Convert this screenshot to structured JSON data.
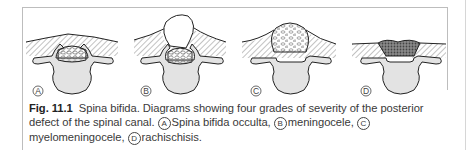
{
  "figure": {
    "panels": [
      {
        "letter": "A",
        "name": "Spina bifida occulta"
      },
      {
        "letter": "B",
        "name": "meningocele"
      },
      {
        "letter": "C",
        "name": "myelomeningocele"
      },
      {
        "letter": "D",
        "name": "rachischisis"
      }
    ],
    "colors": {
      "bone": "#e3e3e3",
      "outline": "#222222",
      "hatch": "#555555",
      "frame": "#bdbdbd"
    }
  },
  "caption": {
    "label": "Fig. 11.1",
    "text": "Spina bifida. Diagrams showing four grades of severity of the posterior defect of the spinal canal.",
    "items": [
      {
        "letter": "A",
        "text": "Spina bifida occulta,"
      },
      {
        "letter": "B",
        "text": "meningocele,"
      },
      {
        "letter": "C",
        "text": "myelomeningocele,"
      },
      {
        "letter": "D",
        "text": "rachischisis."
      }
    ]
  }
}
